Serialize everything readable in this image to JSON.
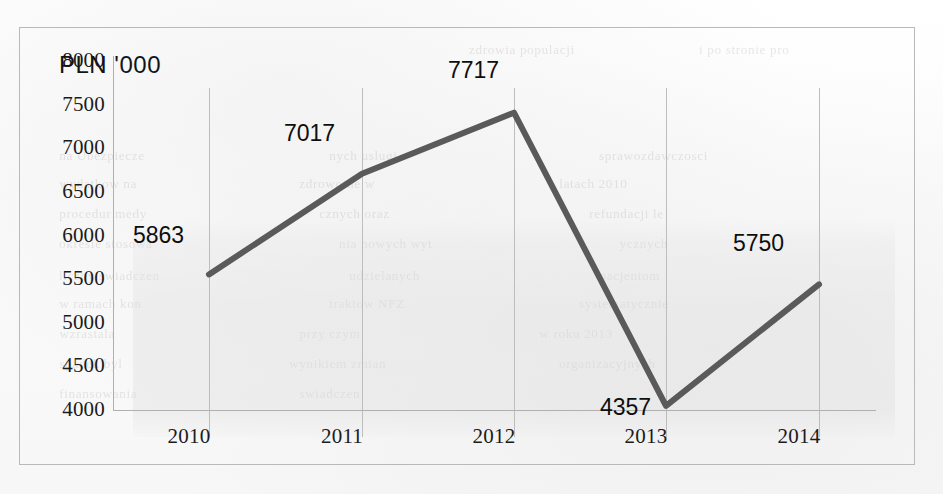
{
  "chart_data": {
    "type": "line",
    "title": "",
    "axis_title": "PLN '000",
    "xlabel": "",
    "ylabel": "PLN '000",
    "categories": [
      "2010",
      "2011",
      "2012",
      "2013",
      "2014"
    ],
    "values": [
      5863,
      7017,
      7717,
      4357,
      5750
    ],
    "series": [
      {
        "name": "PLN '000",
        "values": [
          5863,
          7017,
          7717,
          4357,
          5750
        ]
      }
    ],
    "point_labels": [
      "5863",
      "7017",
      "7717",
      "4357",
      "5750"
    ],
    "ylim": [
      4000,
      8000
    ],
    "ytick_labels": [
      "8000",
      "7500",
      "7000",
      "6500",
      "6000",
      "5500",
      "5000",
      "4500",
      "4000"
    ],
    "ytick_values": [
      8000,
      7500,
      7000,
      6500,
      6000,
      5500,
      5000,
      4500,
      4000
    ],
    "grid": "vertical",
    "legend": "none",
    "line_color": "#5a5a5a",
    "frame_color": "#b9b9b9",
    "gridline_color": "#bdbdbd",
    "text_color": "#1b1b1b"
  },
  "background_text": [
    {
      "text": "zdrowia populacji",
      "x": 470,
      "y": 42
    },
    {
      "text": "i po stronie pro",
      "x": 700,
      "y": 42
    },
    {
      "text": "na Ubezpiecze",
      "x": 60,
      "y": 148
    },
    {
      "text": "nych uslugi",
      "x": 330,
      "y": 148
    },
    {
      "text": "sprawozdawczosci",
      "x": 600,
      "y": 148
    },
    {
      "text": "wydatkow na",
      "x": 60,
      "y": 176
    },
    {
      "text": "zdrowotne w",
      "x": 300,
      "y": 176
    },
    {
      "text": "latach 2010",
      "x": 560,
      "y": 176
    },
    {
      "text": "procedur medy",
      "x": 60,
      "y": 206
    },
    {
      "text": "cznych oraz",
      "x": 320,
      "y": 206
    },
    {
      "text": "refundacji le",
      "x": 590,
      "y": 206
    },
    {
      "text": "okresie stosowa",
      "x": 60,
      "y": 236
    },
    {
      "text": "nia nowych wyt",
      "x": 340,
      "y": 236
    },
    {
      "text": "ycznych",
      "x": 620,
      "y": 236
    },
    {
      "text": "liczby swiadczen",
      "x": 60,
      "y": 268
    },
    {
      "text": "udzielanych",
      "x": 350,
      "y": 268
    },
    {
      "text": "pacjentom",
      "x": 600,
      "y": 268
    },
    {
      "text": "w ramach kon",
      "x": 60,
      "y": 296
    },
    {
      "text": "traktow NFZ",
      "x": 330,
      "y": 296
    },
    {
      "text": "systematycznie",
      "x": 580,
      "y": 296
    },
    {
      "text": "wzrastala",
      "x": 60,
      "y": 326
    },
    {
      "text": "przy czym",
      "x": 300,
      "y": 326
    },
    {
      "text": "w roku 2013",
      "x": 540,
      "y": 326
    },
    {
      "text": "spadek byl",
      "x": 60,
      "y": 356
    },
    {
      "text": "wynikiem zmian",
      "x": 290,
      "y": 356
    },
    {
      "text": "organizacyjnych",
      "x": 560,
      "y": 356
    },
    {
      "text": "finansowania",
      "x": 60,
      "y": 386
    },
    {
      "text": "swiadczen",
      "x": 300,
      "y": 386
    }
  ]
}
